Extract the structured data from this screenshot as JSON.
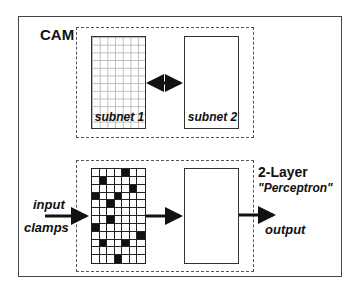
{
  "cam": {
    "title": "CAM",
    "subnet1_label": "subnet 1",
    "subnet2_label": "subnet 2",
    "connection": "bidirectional-arrow"
  },
  "perceptron": {
    "title_line1": "2-Layer",
    "title_line2": "\"Perceptron\"",
    "input_label_line1": "input",
    "input_label_line2": "clamps",
    "output_label": "output",
    "grid": {
      "columns": 7,
      "rows": 12,
      "filled_cells": [
        [
          0,
          4
        ],
        [
          1,
          1
        ],
        [
          2,
          5
        ],
        [
          3,
          0
        ],
        [
          3,
          3
        ],
        [
          4,
          2
        ],
        [
          6,
          2
        ],
        [
          7,
          0
        ],
        [
          8,
          6
        ],
        [
          9,
          1
        ],
        [
          9,
          4
        ],
        [
          11,
          3
        ]
      ]
    }
  },
  "colors": {
    "ink": "#111111",
    "background": "#ffffff",
    "grid_light": "#bbbbbb"
  }
}
